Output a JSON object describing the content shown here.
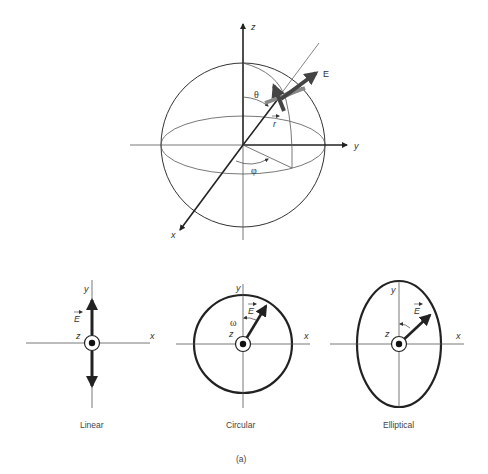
{
  "figure": {
    "caption": "(a)",
    "colors": {
      "line": "#333333",
      "thick": "#222222",
      "arrow_dark": "#444444",
      "arrow_gray": "#888888",
      "background": "#ffffff"
    }
  },
  "sphere": {
    "axes": {
      "x": "x",
      "y": "y",
      "z": "z"
    },
    "field_label": "E",
    "position_vector_label": "r",
    "polar_angle_label": "θ",
    "azimuth_angle_label": "φ"
  },
  "panels": [
    {
      "name": "linear",
      "caption": "Linear",
      "axes": {
        "x": "x",
        "y": "y",
        "z": "z"
      },
      "field_label": "E"
    },
    {
      "name": "circular",
      "caption": "Circular",
      "axes": {
        "x": "x",
        "y": "y",
        "z": "z"
      },
      "field_label": "E",
      "rotation_label": "ω"
    },
    {
      "name": "elliptical",
      "caption": "Elliptical",
      "axes": {
        "x": "x",
        "y": "y",
        "z": "z"
      },
      "field_label": "E"
    }
  ]
}
